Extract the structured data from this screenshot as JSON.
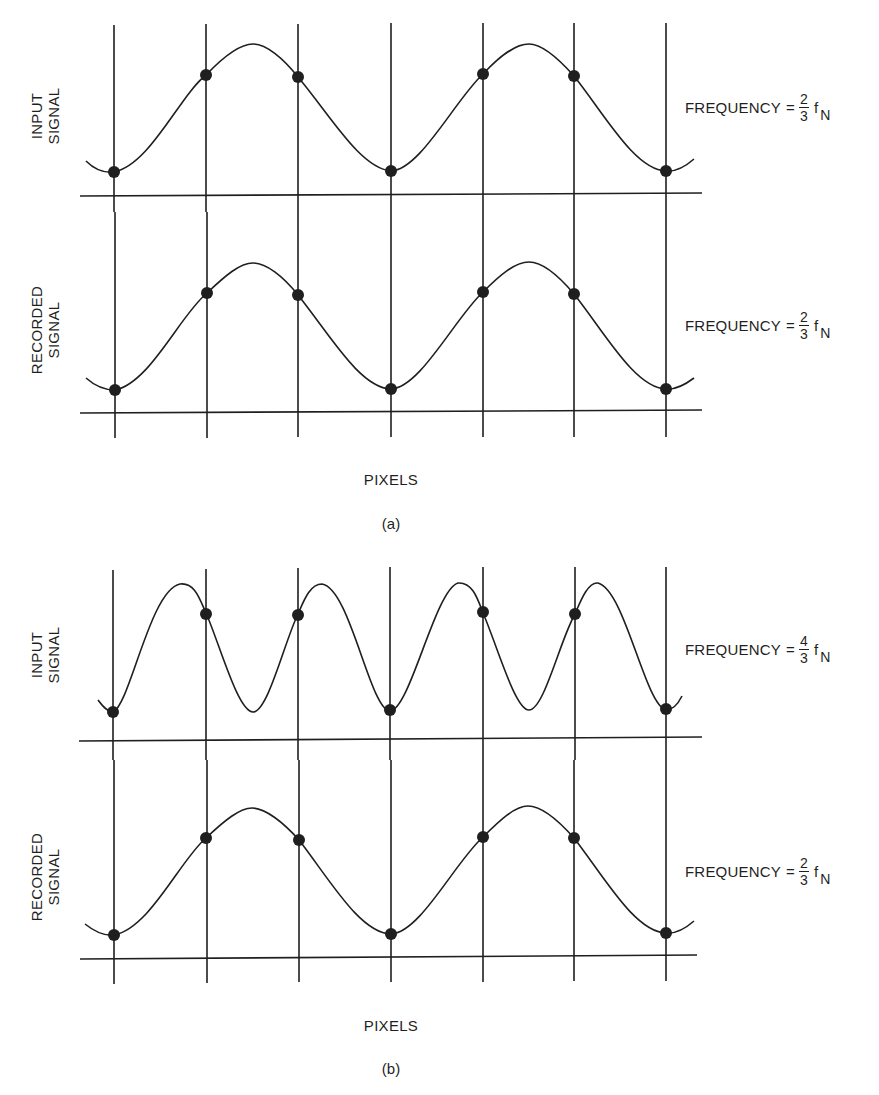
{
  "figure": {
    "panels": [
      {
        "caption": "(a)",
        "xlabel": "PIXELS",
        "rows": [
          {
            "label_line1": "INPUT",
            "label_line2": "SIGNAL",
            "freq_prefix": "FREQUENCY",
            "freq_eq": "=",
            "freq_num": "2",
            "freq_den": "3",
            "freq_symbol": "f",
            "freq_sub": "N"
          },
          {
            "label_line1": "RECORDED",
            "label_line2": "SIGNAL",
            "freq_prefix": "FREQUENCY",
            "freq_eq": "=",
            "freq_num": "2",
            "freq_den": "3",
            "freq_symbol": "f",
            "freq_sub": "N"
          }
        ]
      },
      {
        "caption": "(b)",
        "xlabel": "PIXELS",
        "rows": [
          {
            "label_line1": "INPUT",
            "label_line2": "SIGNAL",
            "freq_prefix": "FREQUENCY",
            "freq_eq": "=",
            "freq_num": "4",
            "freq_den": "3",
            "freq_symbol": "f",
            "freq_sub": "N"
          },
          {
            "label_line1": "RECORDED",
            "label_line2": "SIGNAL",
            "freq_prefix": "FREQUENCY",
            "freq_eq": "=",
            "freq_num": "2",
            "freq_den": "3",
            "freq_symbol": "f",
            "freq_sub": "N"
          }
        ]
      }
    ],
    "pixel_grid_x": [
      114,
      206,
      298,
      391,
      483,
      574,
      666
    ],
    "colors": {
      "ink": "#1f1f1f",
      "background": "#ffffff"
    }
  }
}
